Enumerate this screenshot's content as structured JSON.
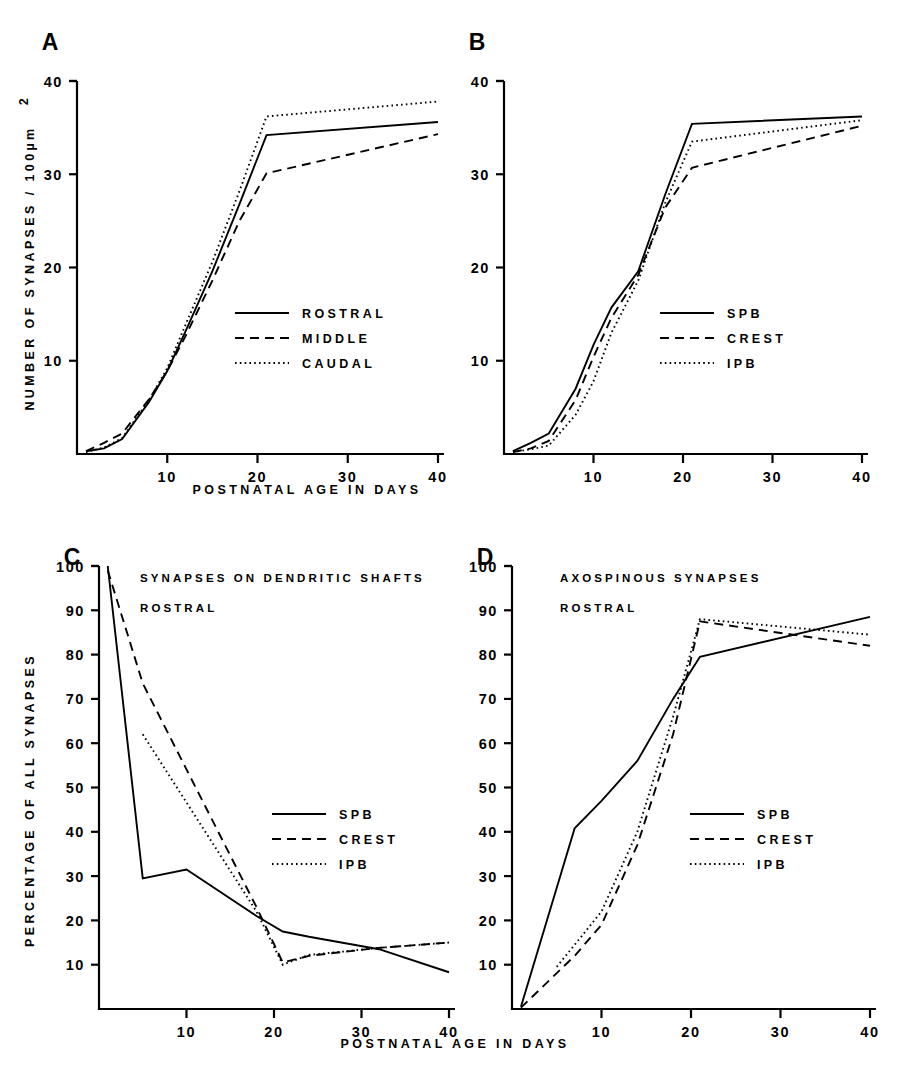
{
  "figure": {
    "axis_title_x": "POSTNATAL  AGE  IN  DAYS",
    "axis_title_y_top": "NUMBER  OF  SYNAPSES  /  100µm",
    "axis_title_y_top_sup": "2",
    "axis_title_y_bottom": "PERCENTAGE  OF  ALL  SYNAPSES"
  },
  "chart_data": [
    {
      "panel": "A",
      "type": "line",
      "title": "",
      "xlabel": "POSTNATAL  AGE  IN  DAYS",
      "ylabel": "NUMBER  OF  SYNAPSES  /  100µm2",
      "xlim": [
        0,
        42
      ],
      "ylim": [
        0,
        40
      ],
      "xticks": [
        10,
        20,
        30,
        40
      ],
      "yticks": [
        10,
        20,
        30,
        40
      ],
      "grid": false,
      "legend_position": "center-right",
      "series": [
        {
          "name": "ROSTRAL",
          "style": "solid",
          "x": [
            1,
            3,
            5,
            8,
            10,
            12,
            15,
            18,
            21,
            40
          ],
          "y": [
            0.3,
            0.6,
            1.6,
            5.6,
            8.9,
            13.1,
            19.6,
            26.8,
            34.2,
            35.6
          ]
        },
        {
          "name": "MIDDLE",
          "style": "dashed",
          "x": [
            1,
            3,
            5,
            8,
            10,
            12,
            15,
            18,
            21,
            40
          ],
          "y": [
            0.3,
            1.2,
            2.2,
            5.9,
            8.9,
            12.6,
            18.6,
            25.0,
            30.1,
            34.3
          ]
        },
        {
          "name": "CAUDAL",
          "style": "dotted",
          "x": [
            1,
            3,
            5,
            8,
            10,
            12,
            15,
            18,
            21,
            40
          ],
          "y": [
            0.2,
            0.7,
            1.7,
            5.8,
            9.2,
            13.8,
            20.6,
            28.2,
            36.2,
            37.8
          ]
        }
      ]
    },
    {
      "panel": "B",
      "type": "line",
      "title": "",
      "xlabel": "POSTNATAL  AGE  IN  DAYS",
      "ylabel": "NUMBER  OF  SYNAPSES  /  100µm2",
      "xlim": [
        0,
        42
      ],
      "ylim": [
        0,
        40
      ],
      "xticks": [
        10,
        20,
        30,
        40
      ],
      "yticks": [
        10,
        20,
        30,
        40
      ],
      "grid": false,
      "legend_position": "center-right",
      "series": [
        {
          "name": "SPB",
          "style": "solid",
          "x": [
            1,
            3,
            5,
            8,
            10,
            12,
            15,
            18,
            21,
            40
          ],
          "y": [
            0.3,
            1.2,
            2.2,
            7.0,
            11.7,
            15.7,
            19.6,
            27.8,
            35.4,
            36.2
          ]
        },
        {
          "name": "CREST",
          "style": "dashed",
          "x": [
            1,
            3,
            5,
            8,
            10,
            12,
            15,
            18,
            21,
            40
          ],
          "y": [
            0.2,
            0.6,
            1.4,
            5.8,
            10.4,
            14.6,
            19.2,
            26.4,
            30.7,
            35.2
          ]
        },
        {
          "name": "IPB",
          "style": "dotted",
          "x": [
            1,
            3,
            5,
            8,
            10,
            12,
            15,
            18,
            21,
            40
          ],
          "y": [
            0.2,
            0.5,
            0.9,
            4.2,
            7.8,
            13.0,
            18.6,
            26.9,
            33.5,
            35.8
          ]
        }
      ]
    },
    {
      "panel": "C",
      "type": "line",
      "title": "SYNAPSES  ON  DENDRITIC  SHAFTS",
      "subtitle": "ROSTRAL",
      "xlabel": "POSTNATAL  AGE  IN  DAYS",
      "ylabel": "PERCENTAGE  OF  ALL  SYNAPSES",
      "xlim": [
        0,
        42
      ],
      "ylim": [
        0,
        100
      ],
      "xticks": [
        10,
        20,
        30,
        40
      ],
      "yticks": [
        10,
        20,
        30,
        40,
        50,
        60,
        70,
        80,
        90,
        100
      ],
      "grid": false,
      "legend_position": "center-right",
      "series": [
        {
          "name": "SPB",
          "style": "solid",
          "x": [
            1,
            5,
            10,
            18,
            21,
            24,
            32,
            40
          ],
          "y": [
            100.0,
            29.5,
            31.5,
            21.0,
            17.5,
            16.3,
            13.5,
            8.3
          ]
        },
        {
          "name": "CREST",
          "style": "dashed",
          "x": [
            1,
            5,
            18,
            21,
            24,
            32,
            40
          ],
          "y": [
            99.0,
            73.5,
            23.0,
            10.5,
            12.0,
            13.8,
            15.0
          ]
        },
        {
          "name": "IPB",
          "style": "dotted",
          "x": [
            5,
            18,
            21,
            24,
            32,
            40
          ],
          "y": [
            62.0,
            22.0,
            10.0,
            12.2,
            13.8,
            15.0
          ]
        }
      ]
    },
    {
      "panel": "D",
      "type": "line",
      "title": "AXOSPINOUS  SYNAPSES",
      "subtitle": "ROSTRAL",
      "xlabel": "POSTNATAL  AGE  IN  DAYS",
      "ylabel": "PERCENTAGE  OF  ALL  SYNAPSES",
      "xlim": [
        0,
        42
      ],
      "ylim": [
        0,
        100
      ],
      "xticks": [
        10,
        20,
        30,
        40
      ],
      "yticks": [
        10,
        20,
        30,
        40,
        50,
        60,
        70,
        80,
        90,
        100
      ],
      "grid": false,
      "legend_position": "center-right",
      "series": [
        {
          "name": "SPB",
          "style": "solid",
          "x": [
            1,
            7,
            10,
            14,
            18,
            21,
            40
          ],
          "y": [
            0.5,
            40.8,
            47.0,
            56.0,
            70.0,
            79.5,
            88.5
          ]
        },
        {
          "name": "CREST",
          "style": "dashed",
          "x": [
            1,
            7,
            10,
            14,
            18,
            21,
            40
          ],
          "y": [
            0.3,
            12.0,
            19.0,
            37.0,
            62.0,
            87.5,
            82.0
          ]
        },
        {
          "name": "IPB",
          "style": "dotted",
          "x": [
            5,
            7,
            10,
            14,
            18,
            21,
            40
          ],
          "y": [
            9.5,
            14.5,
            22.0,
            40.0,
            66.0,
            88.0,
            84.5
          ]
        }
      ]
    }
  ],
  "panels": {
    "a": {
      "letter": "A",
      "yticks": [
        "40",
        "30",
        "20",
        "10"
      ],
      "xticks": [
        "10",
        "20",
        "30",
        "40"
      ],
      "legend": [
        {
          "label": "ROSTRAL",
          "style": "solid"
        },
        {
          "label": "MIDDLE",
          "style": "dashed"
        },
        {
          "label": "CAUDAL",
          "style": "dotted"
        }
      ]
    },
    "b": {
      "letter": "B",
      "yticks": [
        "40",
        "30",
        "20",
        "10"
      ],
      "xticks": [
        "10",
        "20",
        "30",
        "40"
      ],
      "legend": [
        {
          "label": "SPB",
          "style": "solid"
        },
        {
          "label": "CREST",
          "style": "dashed"
        },
        {
          "label": "IPB",
          "style": "dotted"
        }
      ]
    },
    "c": {
      "letter": "C",
      "title": "SYNAPSES  ON  DENDRITIC  SHAFTS",
      "subtitle": "ROSTRAL",
      "yticks": [
        "100",
        "90",
        "80",
        "70",
        "60",
        "50",
        "40",
        "30",
        "20",
        "10"
      ],
      "xticks": [
        "10",
        "20",
        "30",
        "40"
      ],
      "legend": [
        {
          "label": "SPB",
          "style": "solid"
        },
        {
          "label": "CREST",
          "style": "dashed"
        },
        {
          "label": "IPB",
          "style": "dotted"
        }
      ]
    },
    "d": {
      "letter": "D",
      "title": "AXOSPINOUS  SYNAPSES",
      "subtitle": "ROSTRAL",
      "yticks": [
        "100",
        "90",
        "80",
        "70",
        "60",
        "50",
        "40",
        "30",
        "20",
        "10"
      ],
      "xticks": [
        "10",
        "20",
        "30",
        "40"
      ],
      "legend": [
        {
          "label": "SPB",
          "style": "solid"
        },
        {
          "label": "CREST",
          "style": "dashed"
        },
        {
          "label": "IPB",
          "style": "dotted"
        }
      ]
    }
  }
}
